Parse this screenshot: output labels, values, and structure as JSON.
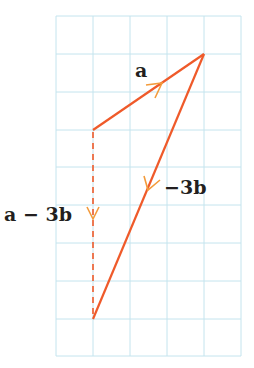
{
  "diagram": {
    "grid": {
      "cols": 5,
      "rows": 9,
      "cell": 37.5,
      "origin_x": 56,
      "origin_y": 16,
      "color": "#bfe3ef"
    },
    "colors": {
      "vector": "#ef5a2a",
      "arrowhead": "#f39b3b",
      "text": "#231f20"
    },
    "vectors": [
      {
        "name": "a",
        "label": "a",
        "from": [
          93,
          130
        ],
        "to": [
          204,
          54
        ],
        "style": "solid"
      },
      {
        "name": "minus-3b",
        "label": "−3b",
        "from": [
          204,
          54
        ],
        "to": [
          93,
          319
        ],
        "style": "solid"
      },
      {
        "name": "a-minus-3b",
        "label": "a − 3b",
        "from": [
          93,
          130
        ],
        "to": [
          93,
          319
        ],
        "style": "dashed"
      }
    ],
    "labels": {
      "a": "a",
      "minus_3b": "−3b",
      "a_minus_3b": "a − 3b"
    }
  }
}
